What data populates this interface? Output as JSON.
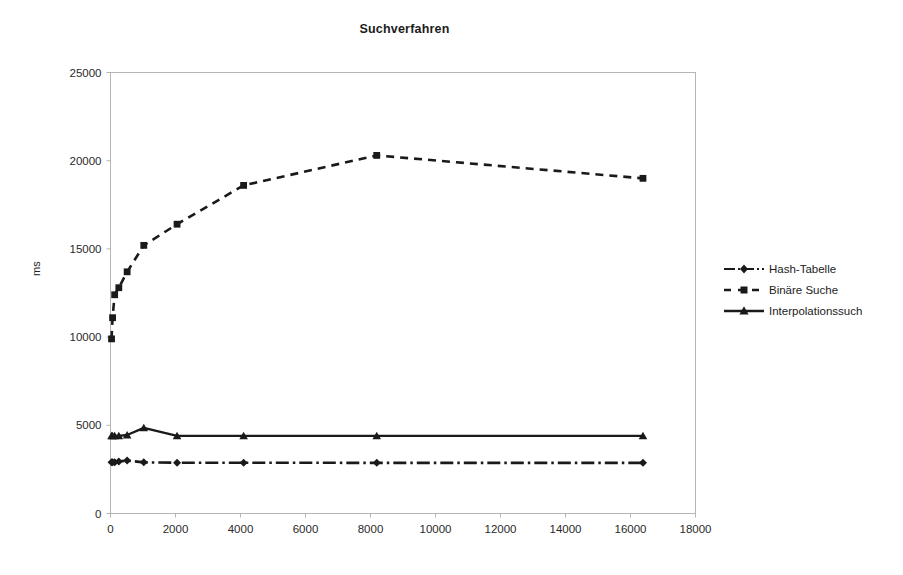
{
  "chart_data": {
    "type": "line",
    "title": "Suchverfahren",
    "xlabel": "",
    "ylabel": "ms",
    "xlim": [
      0,
      18000
    ],
    "ylim": [
      0,
      25000
    ],
    "xticks": [
      0,
      2000,
      4000,
      6000,
      8000,
      10000,
      12000,
      14000,
      16000,
      18000
    ],
    "yticks": [
      0,
      5000,
      10000,
      15000,
      20000,
      25000
    ],
    "grid": false,
    "legend_position": "right",
    "series": [
      {
        "name": "Hash-Tabelle",
        "style": "dash-dot",
        "marker": "diamond",
        "x": [
          32,
          64,
          128,
          256,
          512,
          1024,
          2048,
          4096,
          8192,
          16384
        ],
        "y": [
          2900,
          2900,
          2900,
          2950,
          3000,
          2900,
          2880,
          2880,
          2870,
          2870
        ]
      },
      {
        "name": "Binäre Suche",
        "style": "dashed",
        "marker": "square",
        "x": [
          32,
          64,
          128,
          256,
          512,
          1024,
          2048,
          4096,
          8192,
          16384
        ],
        "y": [
          9900,
          11100,
          12400,
          12800,
          13700,
          15200,
          16400,
          18600,
          20300,
          19000
        ]
      },
      {
        "name": "Interpolationssuch",
        "style": "solid",
        "marker": "triangle",
        "x": [
          32,
          64,
          128,
          256,
          512,
          1024,
          2048,
          4096,
          8192,
          16384
        ],
        "y": [
          4400,
          4400,
          4400,
          4400,
          4450,
          4850,
          4400,
          4400,
          4400,
          4400
        ]
      }
    ]
  },
  "legend": {
    "items": [
      {
        "label": "Hash-Tabelle",
        "key": "line-key-dashdot-diamond"
      },
      {
        "label": "Binäre Suche",
        "key": "line-key-dashed-square"
      },
      {
        "label": "Interpolationssuch",
        "key": "line-key-solid-triangle"
      }
    ]
  },
  "axes": {
    "y_title": "ms",
    "x_tick_labels": [
      "0",
      "2000",
      "4000",
      "6000",
      "8000",
      "10000",
      "12000",
      "14000",
      "16000",
      "18000"
    ],
    "y_tick_labels": [
      "0",
      "5000",
      "10000",
      "15000",
      "20000",
      "25000"
    ]
  },
  "colors": {
    "series": "#1a1a1a",
    "axis": "#9a9a9a",
    "text": "#1c1c1c",
    "background": "#ffffff"
  }
}
